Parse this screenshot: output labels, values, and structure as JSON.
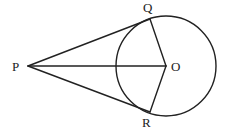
{
  "diagram": {
    "type": "geometry",
    "colors": {
      "stroke": "#222222",
      "background": "#ffffff"
    },
    "circle": {
      "center_label": "O",
      "cx": 166,
      "cy": 66,
      "r": 50
    },
    "points": {
      "P": {
        "label": "P",
        "x": 28,
        "y": 66,
        "label_x": 12,
        "label_y": 71
      },
      "O": {
        "label": "O",
        "x": 166,
        "y": 66,
        "label_x": 171,
        "label_y": 71
      },
      "Q": {
        "label": "Q",
        "x": 150,
        "y": 19,
        "label_x": 143,
        "label_y": 12
      },
      "R": {
        "label": "R",
        "x": 150,
        "y": 112,
        "label_x": 142,
        "label_y": 127
      }
    },
    "segments": [
      "PQ",
      "PR",
      "PO",
      "OQ",
      "OR"
    ]
  }
}
